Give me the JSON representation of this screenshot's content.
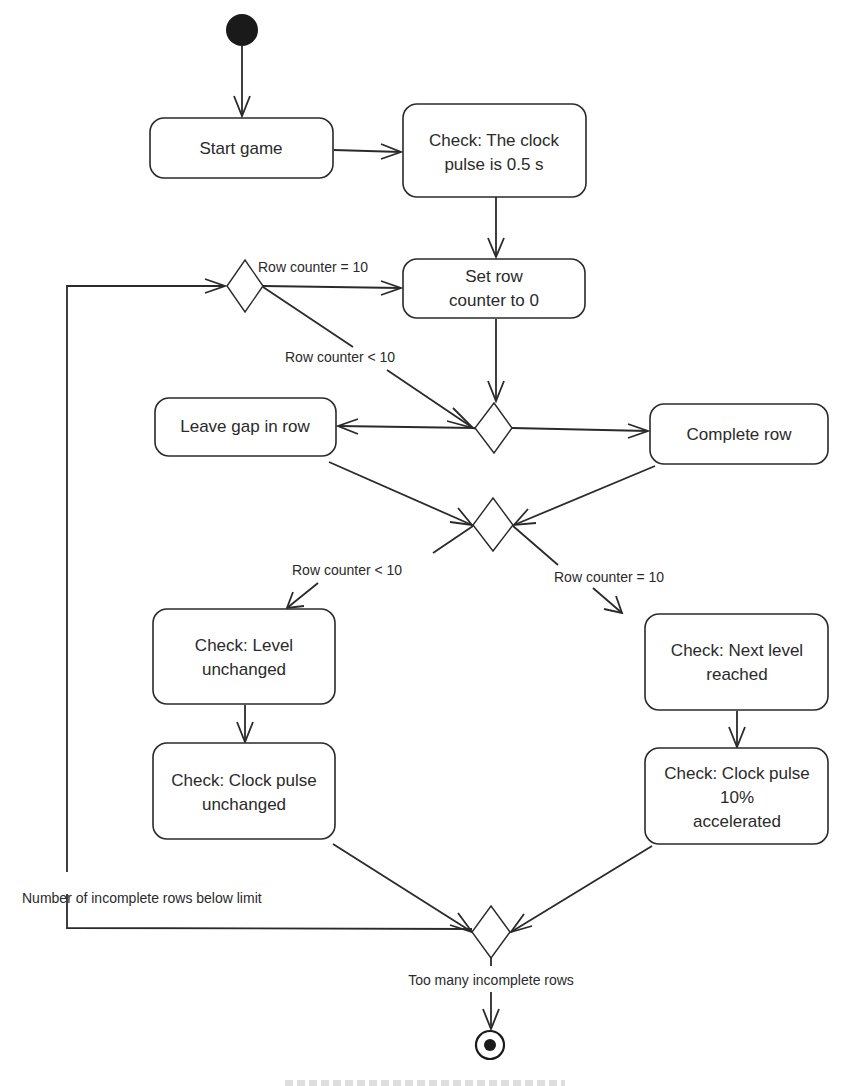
{
  "diagram": {
    "type": "UML activity diagram",
    "colors": {
      "stroke": "#2a2a2a",
      "background": "#ffffff"
    },
    "nodes": {
      "start_game": {
        "lines": [
          "Start game"
        ]
      },
      "check_clock_initial": {
        "lines": [
          "Check: The clock",
          "pulse is 0.5 s"
        ]
      },
      "set_row_counter": {
        "lines": [
          "Set row",
          "counter to 0"
        ]
      },
      "leave_gap": {
        "lines": [
          "Leave gap in row"
        ]
      },
      "complete_row": {
        "lines": [
          "Complete row"
        ]
      },
      "level_unchanged": {
        "lines": [
          "Check: Level",
          "unchanged"
        ]
      },
      "next_level": {
        "lines": [
          "Check: Next level",
          "reached"
        ]
      },
      "clock_unchanged": {
        "lines": [
          "Check: Clock pulse",
          "unchanged"
        ]
      },
      "clock_accelerated": {
        "lines": [
          "Check: Clock pulse",
          "10%",
          "accelerated"
        ]
      }
    },
    "guards": {
      "d1_eq": "Row counter = 10",
      "d1_lt": "Row counter < 10",
      "d3_lt": "Row counter < 10",
      "d3_eq": "Row counter = 10",
      "d4_loop": "Number of incomplete rows below limit",
      "d4_exit": "Too many incomplete rows"
    }
  }
}
